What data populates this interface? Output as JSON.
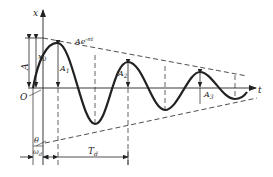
{
  "labels": {
    "x_axis": "x",
    "t_axis": "t",
    "origin": "O",
    "amplitude": "A",
    "x0": "x",
    "x0_sub": "0",
    "envelope": "Ae",
    "envelope_exp": "-nt",
    "A1": "A",
    "A1_sub": "1",
    "A2": "A",
    "A2_sub": "2",
    "A3": "A",
    "A3_sub": "3",
    "theta": "θ",
    "omega": "ω",
    "omega_sub": "d",
    "period": "T",
    "period_sub": "d"
  },
  "colors": {
    "ink": "#222222",
    "background": "#ffffff"
  }
}
